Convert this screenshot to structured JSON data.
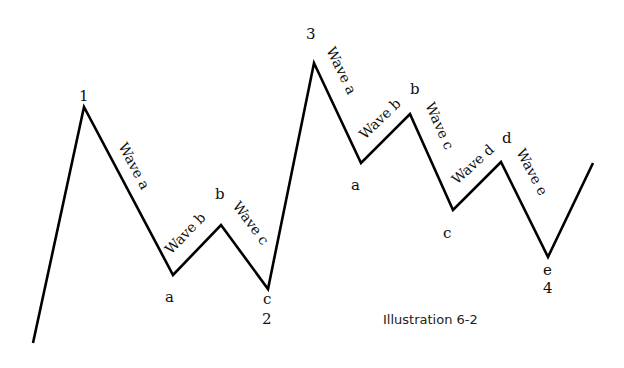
{
  "diagram": {
    "caption": "Illustration 6-2",
    "line_color": "#000000",
    "path_points": [
      [
        33,
        343
      ],
      [
        84,
        107
      ],
      [
        173,
        275
      ],
      [
        221,
        225
      ],
      [
        268,
        289
      ],
      [
        314,
        63
      ],
      [
        361,
        163
      ],
      [
        410,
        114
      ],
      [
        453,
        210
      ],
      [
        501,
        162
      ],
      [
        548,
        257
      ],
      [
        593,
        163
      ]
    ],
    "point_labels": {
      "p1": "1",
      "p1_a": "a",
      "p1_b": "b",
      "p1_c": "c",
      "p2": "2",
      "p3": "3",
      "p3_a": "a",
      "p3_b": "b",
      "p3_c": "c",
      "p3_d": "d",
      "p3_e": "e",
      "p4": "4"
    },
    "wave_labels": {
      "first_wave_a": "Wave a",
      "first_wave_b": "Wave b",
      "first_wave_c": "Wave c",
      "second_wave_a": "Wave a",
      "second_wave_b": "Wave b",
      "second_wave_c": "Wave c",
      "second_wave_d": "Wave d",
      "second_wave_e": "Wave e"
    }
  }
}
